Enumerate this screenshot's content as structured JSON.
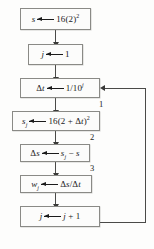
{
  "diagram": {
    "colors": {
      "box_border": "#8a8a86",
      "box_fill": "#fcfcfb",
      "connector": "#4a4a48",
      "text": "#1b1b1b",
      "background": "#fdfdfc"
    },
    "nodes": [
      {
        "id": "init-s",
        "target": "s",
        "operator": "←",
        "expression": "16(2)²",
        "text": "s ← 16(2)²"
      },
      {
        "id": "init-j",
        "target": "j",
        "operator": "←",
        "expression": "1",
        "text": "j ← 1"
      },
      {
        "id": "delta-t",
        "target": "Δt",
        "operator": "←",
        "expression": "1/10ʲ",
        "text": "Δt ← 1/10ʲ"
      },
      {
        "id": "s-sub-j",
        "target": "sⱼ",
        "operator": "←",
        "expression": "16(2 + Δt)²",
        "text": "sⱼ ← 16(2 + Δt)²"
      },
      {
        "id": "delta-s",
        "target": "Δs",
        "operator": "←",
        "expression": "sⱼ − s",
        "text": "Δs ← sⱼ − s"
      },
      {
        "id": "w-sub-j",
        "target": "wⱼ",
        "operator": "←",
        "expression": "Δs/Δt",
        "text": "wⱼ ← Δs/Δt"
      },
      {
        "id": "increment-j",
        "target": "j",
        "operator": "←",
        "expression": "j + 1",
        "text": "j ← j + 1"
      }
    ],
    "step_labels": [
      "1",
      "2",
      "3"
    ],
    "loop": {
      "from": "increment-j",
      "to": "delta-t",
      "direction": "feedback-right"
    }
  }
}
